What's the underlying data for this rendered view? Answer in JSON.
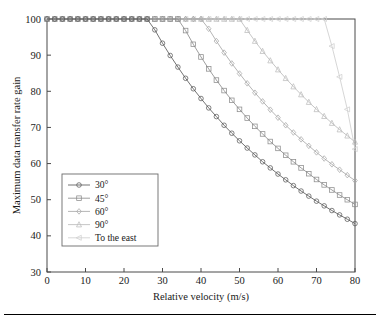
{
  "chart_data": {
    "type": "line",
    "title": "",
    "xlabel": "Relative velocity (m/s)",
    "ylabel": "Maximum data transfer rate gain",
    "xlim": [
      0,
      80
    ],
    "ylim": [
      30,
      100
    ],
    "xticks": [
      0,
      10,
      20,
      30,
      40,
      50,
      60,
      70,
      80
    ],
    "yticks": [
      30,
      40,
      50,
      60,
      70,
      80,
      90,
      100
    ],
    "grid": false,
    "legend_position": "lower-left-inside",
    "series": [
      {
        "name": "30°",
        "marker": "circle",
        "color": "#5a5a5a",
        "breakpoint_x": 26,
        "end_value": 33,
        "x": [
          0,
          2,
          4,
          6,
          8,
          10,
          12,
          14,
          16,
          18,
          20,
          22,
          24,
          26,
          28,
          30,
          32,
          34,
          36,
          38,
          40,
          42,
          44,
          46,
          48,
          50,
          52,
          54,
          56,
          58,
          60,
          62,
          64,
          66,
          68,
          70,
          72,
          74,
          76,
          78,
          80
        ],
        "values": [
          100,
          100,
          100,
          100,
          100,
          100,
          100,
          100,
          100,
          100,
          100,
          100,
          100,
          100,
          97.0,
          93.3,
          89.9,
          86.7,
          83.6,
          80.7,
          78.0,
          75.4,
          73.0,
          70.6,
          68.4,
          66.3,
          64.3,
          62.4,
          60.5,
          58.8,
          57.1,
          55.5,
          53.9,
          52.4,
          51.0,
          49.6,
          48.3,
          47.0,
          45.8,
          44.6,
          43.4
        ]
      },
      {
        "name": "45°",
        "marker": "square",
        "color": "#8c8c8c",
        "breakpoint_x": 34,
        "end_value": 42,
        "x": [
          0,
          2,
          4,
          6,
          8,
          10,
          12,
          14,
          16,
          18,
          20,
          22,
          24,
          26,
          28,
          30,
          32,
          34,
          36,
          38,
          40,
          42,
          44,
          46,
          48,
          50,
          52,
          54,
          56,
          58,
          60,
          62,
          64,
          66,
          68,
          70,
          72,
          74,
          76,
          78,
          80
        ],
        "values": [
          100,
          100,
          100,
          100,
          100,
          100,
          100,
          100,
          100,
          100,
          100,
          100,
          100,
          100,
          100,
          100,
          100,
          100,
          96.8,
          93.0,
          89.5,
          86.2,
          83.1,
          80.2,
          77.5,
          75.0,
          72.6,
          70.3,
          68.2,
          66.1,
          64.2,
          62.3,
          60.5,
          58.8,
          57.2,
          55.6,
          54.1,
          52.7,
          51.3,
          50.0,
          48.7
        ]
      },
      {
        "name": "60°",
        "marker": "diamond",
        "color": "#a8a8a8",
        "breakpoint_x": 41,
        "end_value": 49,
        "x": [
          0,
          2,
          4,
          6,
          8,
          10,
          12,
          14,
          16,
          18,
          20,
          22,
          24,
          26,
          28,
          30,
          32,
          34,
          36,
          38,
          40,
          42,
          44,
          46,
          48,
          50,
          52,
          54,
          56,
          58,
          60,
          62,
          64,
          66,
          68,
          70,
          72,
          74,
          76,
          78,
          80
        ],
        "values": [
          100,
          100,
          100,
          100,
          100,
          100,
          100,
          100,
          100,
          100,
          100,
          100,
          100,
          100,
          100,
          100,
          100,
          100,
          100,
          100,
          100,
          97.3,
          93.9,
          90.7,
          87.7,
          84.9,
          82.2,
          79.6,
          77.2,
          74.9,
          72.7,
          70.6,
          68.6,
          66.7,
          64.9,
          63.1,
          61.4,
          59.8,
          58.3,
          56.8,
          55.3
        ]
      },
      {
        "name": "90°",
        "marker": "triangle-up",
        "color": "#bcbcbc",
        "breakpoint_x": 50,
        "end_value": 58,
        "x": [
          0,
          2,
          4,
          6,
          8,
          10,
          12,
          14,
          16,
          18,
          20,
          22,
          24,
          26,
          28,
          30,
          32,
          34,
          36,
          38,
          40,
          42,
          44,
          46,
          48,
          50,
          52,
          54,
          56,
          58,
          60,
          62,
          64,
          66,
          68,
          70,
          72,
          74,
          76,
          78,
          80
        ],
        "values": [
          100,
          100,
          100,
          100,
          100,
          100,
          100,
          100,
          100,
          100,
          100,
          100,
          100,
          100,
          100,
          100,
          100,
          100,
          100,
          100,
          100,
          100,
          100,
          100,
          100,
          100,
          96.9,
          93.9,
          91.1,
          88.5,
          86.0,
          83.6,
          81.3,
          79.1,
          77.0,
          75.0,
          73.1,
          71.2,
          69.4,
          67.7,
          66.0
        ]
      },
      {
        "name": "To the east",
        "marker": "triangle-left",
        "color": "#cfcfcf",
        "breakpoint_x": 72,
        "end_value": 64,
        "x": [
          0,
          2,
          4,
          6,
          8,
          10,
          12,
          14,
          16,
          18,
          20,
          22,
          24,
          26,
          28,
          30,
          32,
          34,
          36,
          38,
          40,
          42,
          44,
          46,
          48,
          50,
          52,
          54,
          56,
          58,
          60,
          62,
          64,
          66,
          68,
          70,
          72,
          74,
          76,
          78,
          80
        ],
        "values": [
          100,
          100,
          100,
          100,
          100,
          100,
          100,
          100,
          100,
          100,
          100,
          100,
          100,
          100,
          100,
          100,
          100,
          100,
          100,
          100,
          100,
          100,
          100,
          100,
          100,
          100,
          100,
          100,
          100,
          100,
          100,
          100,
          100,
          100,
          100,
          100,
          100,
          92.5,
          84.0,
          75.0,
          64.0
        ]
      }
    ]
  },
  "legend": {
    "entries": [
      {
        "label": "30°"
      },
      {
        "label": "45°"
      },
      {
        "label": "60°"
      },
      {
        "label": "90°"
      },
      {
        "label": "To the east"
      }
    ]
  }
}
